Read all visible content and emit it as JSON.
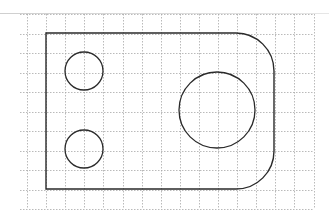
{
  "diagram": {
    "type": "technical-drawing",
    "colors": {
      "background": "#ffffff",
      "grid": "#a8a8a8",
      "outline": "#2a2a2a"
    },
    "grid": {
      "x0": 27,
      "y0": 14,
      "cell": 19.1,
      "cols": 15,
      "rows": 10
    },
    "plate": {
      "left": 46,
      "top": 33,
      "right": 274,
      "bottom": 189,
      "corner_radius_right": 38
    },
    "holes": [
      {
        "name": "top-left-hole",
        "cx": 84,
        "cy": 71,
        "r": 19
      },
      {
        "name": "bottom-left-hole",
        "cx": 84,
        "cy": 149,
        "r": 19
      },
      {
        "name": "large-right-hole",
        "cx": 217,
        "cy": 110,
        "r": 38
      }
    ]
  }
}
